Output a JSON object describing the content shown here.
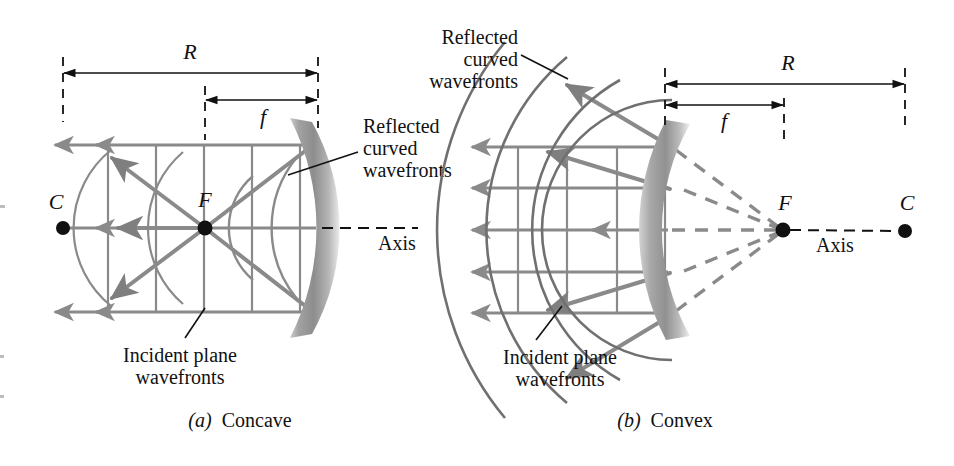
{
  "figure": {
    "type": "optics-diagram",
    "background_color": "#ffffff",
    "ray_color": "#8a8a8a",
    "wavefront_color": "#707070",
    "mirror_color": "#9a9a9a",
    "ink_color": "#111111"
  },
  "panels": [
    {
      "id": "a",
      "caption_letter": "(a)",
      "caption_word": "Concave",
      "dimension_labels": {
        "radius": "R",
        "focal": "f"
      },
      "point_labels": {
        "center": "C",
        "focus": "F"
      },
      "axis_label": "Axis",
      "annotations": {
        "reflected": "Reflected",
        "reflected_line2": "curved",
        "reflected_line3": "wavefronts",
        "incident_line1": "Incident plane",
        "incident_line2": "wavefronts"
      },
      "geometry": {
        "axis_y": 228,
        "center_x": 63,
        "focus_x": 205,
        "mirror_vertex_x": 318,
        "plane_wavefront_x": [
          108,
          156,
          204,
          252,
          300
        ],
        "ray_y": [
          145,
          228,
          312
        ],
        "R_span": [
          63,
          318
        ],
        "f_span": [
          205,
          318
        ],
        "R_line_y": 73,
        "f_line_y": 100
      }
    },
    {
      "id": "b",
      "caption_letter": "(b)",
      "caption_word": "Convex",
      "dimension_labels": {
        "radius": "R",
        "focal": "f"
      },
      "point_labels": {
        "center": "C",
        "focus": "F"
      },
      "axis_label": "Axis",
      "annotations": {
        "reflected": "Reflected",
        "reflected_line2": "curved",
        "reflected_line3": "wavefronts",
        "incident_line1": "Incident plane",
        "incident_line2": "wavefronts"
      },
      "geometry": {
        "axis_y": 230,
        "center_x": 905,
        "focus_x": 783,
        "mirror_vertex_x": 666,
        "plane_wavefront_x": [
          518,
          567,
          617,
          665
        ],
        "ray_y": [
          147,
          188,
          230,
          272,
          313
        ],
        "R_span": [
          665,
          905
        ],
        "f_span": [
          665,
          784
        ],
        "R_line_y": 84,
        "f_line_y": 105
      }
    }
  ]
}
